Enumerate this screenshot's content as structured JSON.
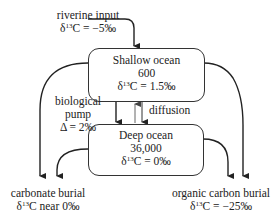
{
  "diagram": {
    "type": "carbon-isotope box model",
    "riverine_input": {
      "title": "riverine input",
      "delta_prefix": "δ",
      "delta_sup": "13",
      "delta_value": "C = −5‰"
    },
    "shallow_ocean": {
      "title": "Shallow ocean",
      "size": "600",
      "delta_prefix": "δ",
      "delta_sup": "13",
      "delta_value": "C = 1.5‰"
    },
    "deep_ocean": {
      "title": "Deep ocean",
      "size": "36,000",
      "delta_prefix": "δ",
      "delta_sup": "13",
      "delta_value": "C = 0‰"
    },
    "biological_pump": {
      "line1": "biological",
      "line2": "pump",
      "line3": "Δ = 2‰"
    },
    "diffusion": {
      "label": "diffusion"
    },
    "carbonate_burial": {
      "title": "carbonate burial",
      "delta_prefix": "δ",
      "delta_sup": "13",
      "delta_value": "C near 0‰"
    },
    "organic_burial": {
      "title": "organic carbon burial",
      "delta_prefix": "δ",
      "delta_sup": "13",
      "delta_value": "C = −25‰"
    },
    "colors": {
      "line": "#222222",
      "thin_line": "#555555",
      "background": "#ffffff"
    }
  }
}
